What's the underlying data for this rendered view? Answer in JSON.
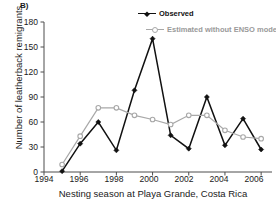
{
  "panel": {
    "label": "B)"
  },
  "legend": {
    "position": "top-right",
    "observed_label": "Observed",
    "estimated_label": "Estimated without ENSO model"
  },
  "colors": {
    "observed": "#111111",
    "estimated": "#a8a8a8",
    "axis": "#4d4d4d",
    "background": "#ffffff"
  },
  "axes": {
    "y_ticks": [
      "180",
      "150",
      "120",
      "90",
      "60",
      "30",
      "0"
    ],
    "x_ticks": [
      "1994",
      "1996",
      "1998",
      "2000",
      "2002",
      "2004",
      "2006"
    ],
    "ylabel": "Number of leatherback remigrants",
    "xlabel": "Nesting season at Playa Grande, Costa Rica"
  },
  "chart_data": {
    "type": "line",
    "title": "B)",
    "xlabel": "Nesting season at Playa Grande, Costa Rica",
    "ylabel": "Number of leatherback remigrants",
    "xlim": [
      1994,
      2006.6
    ],
    "ylim": [
      0,
      180
    ],
    "ytick_values": [
      0,
      30,
      60,
      90,
      120,
      150,
      180
    ],
    "xtick_values": [
      1994,
      1996,
      1998,
      2000,
      2002,
      2004,
      2006
    ],
    "grid": false,
    "legend_position": "top-right",
    "x": [
      1995,
      1996,
      1997,
      1998,
      1999,
      2000,
      2001,
      2002,
      2003,
      2004,
      2005,
      2006
    ],
    "series": [
      {
        "name": "Observed",
        "color": "#111111",
        "marker": "filled-diamond",
        "values": [
          1,
          34,
          60,
          26,
          98,
          160,
          44,
          28,
          90,
          32,
          64,
          27
        ]
      },
      {
        "name": "Estimated without ENSO model",
        "color": "#a8a8a8",
        "marker": "open-circle",
        "values": [
          9,
          43,
          77,
          77,
          68,
          63,
          57,
          68,
          68,
          50,
          42,
          40
        ]
      }
    ]
  }
}
